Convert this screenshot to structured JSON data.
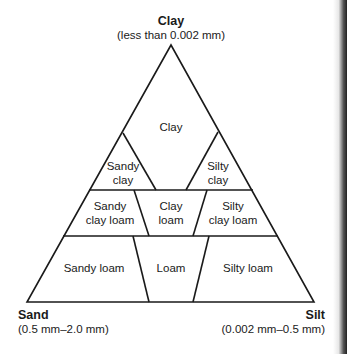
{
  "diagram": {
    "vertices": {
      "top": {
        "name": "Clay",
        "range": "(less than 0.002 mm)"
      },
      "bottom_left": {
        "name": "Sand",
        "range": "(0.5 mm–2.0 mm)"
      },
      "bottom_right": {
        "name": "Silt",
        "range": "(0.002 mm–0.5 mm)"
      }
    },
    "regions": {
      "clay": "Clay",
      "sandy_clay_1": "Sandy",
      "sandy_clay_2": "clay",
      "silty_clay_1": "Silty",
      "silty_clay_2": "clay",
      "sandy_clay_loam_1": "Sandy",
      "sandy_clay_loam_2": "clay loam",
      "clay_loam_1": "Clay",
      "clay_loam_2": "loam",
      "silty_clay_loam_1": "Silty",
      "silty_clay_loam_2": "clay loam",
      "sandy_loam": "Sandy loam",
      "loam": "Loam",
      "silty_loam": "Silty loam"
    },
    "colors": {
      "line": "#1a1a1a",
      "background": "#ffffff"
    }
  }
}
